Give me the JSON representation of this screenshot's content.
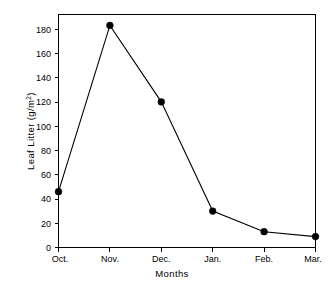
{
  "chart_data": {
    "type": "line",
    "title": "",
    "subtitle": "",
    "xlabel": "Months",
    "ylabel": "Leaf Litter (g/m2)",
    "ylabel_base": "Leaf Litter (g/m",
    "ylabel_sup": "2",
    "ylabel_tail": ")",
    "categories": [
      "Oct.",
      "Nov.",
      "Dec.",
      "Jan.",
      "Feb.",
      "Mar."
    ],
    "values": [
      46,
      183,
      120,
      30,
      13,
      9
    ],
    "series": [
      {
        "name": "Leaf Litter",
        "values": [
          46,
          183,
          120,
          30,
          13,
          9
        ]
      }
    ],
    "xtick_labels": [
      "Oct.",
      "Nov.",
      "Dec.",
      "Jan.",
      "Feb.",
      "Mar."
    ],
    "ytick_labels": [
      "0",
      "20",
      "40",
      "60",
      "80",
      "100",
      "120",
      "140",
      "160",
      "180"
    ],
    "ytick_values": [
      0,
      20,
      40,
      60,
      80,
      100,
      120,
      140,
      160,
      180
    ],
    "ylim": [
      0,
      192
    ],
    "xlim": [
      0,
      5
    ],
    "grid": false,
    "legend": false,
    "legend_position": "none",
    "marker": "filled-circle",
    "line_color": "#000000",
    "marker_color": "#000000",
    "background_color": "#ffffff",
    "annotations": []
  }
}
